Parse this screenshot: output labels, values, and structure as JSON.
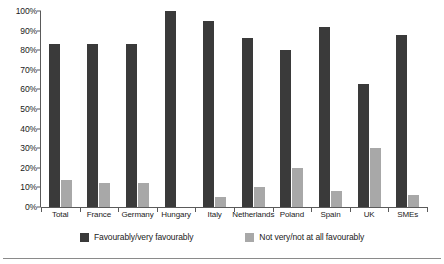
{
  "chart_data": {
    "type": "bar",
    "title": "",
    "xlabel": "",
    "ylabel": "",
    "ylim": [
      0,
      100
    ],
    "yticks": [
      "0%",
      "10%",
      "20%",
      "30%",
      "40%",
      "50%",
      "60%",
      "70%",
      "80%",
      "90%",
      "100%"
    ],
    "ytick_values": [
      0,
      10,
      20,
      30,
      40,
      50,
      60,
      70,
      80,
      90,
      100
    ],
    "grid": false,
    "legend_position": "bottom",
    "categories": [
      "Total",
      "France",
      "Germany",
      "Hungary",
      "Italy",
      "Netherlands",
      "Poland",
      "Spain",
      "UK",
      "SMEs"
    ],
    "series": [
      {
        "name": "Favourably/very favourably",
        "color": "#3a3a3a",
        "values": [
          83,
          83,
          83,
          100,
          95,
          86,
          80,
          92,
          63,
          88
        ]
      },
      {
        "name": "Not very/not at all favourably",
        "color": "#a8a8a8",
        "values": [
          14,
          12,
          12,
          0,
          5,
          10,
          20,
          8,
          30,
          6
        ]
      }
    ]
  },
  "legend": {
    "items": [
      {
        "label": "Favourably/very favourably",
        "swatch": "dark-swatch"
      },
      {
        "label": "Not very/not at all favourably",
        "swatch": "light-swatch"
      }
    ]
  }
}
